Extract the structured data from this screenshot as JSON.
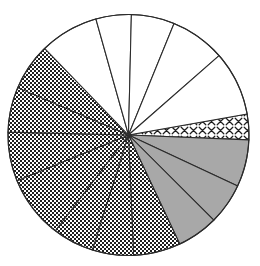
{
  "figure": {
    "title": "",
    "background_color": "#ffffff",
    "outline_color": "#2b2b2b"
  },
  "geometry": {
    "center_x": 128.5,
    "center_y": 135.0,
    "radius": 120.5,
    "stroke_width": 1.05
  },
  "fills": {
    "white": "#ffffff",
    "gray": "#a8a8a8",
    "dotted_bg": "#ffffff",
    "dotted_dot": "#1e1e1e",
    "xhatch_bg": "#ffffff",
    "xhatch_mark": "#1e1e1e",
    "edge": "#2b2b2b"
  },
  "chart_data": {
    "type": "pie",
    "title": "",
    "xlabel": "",
    "ylabel": "",
    "legend_position": "none",
    "grid": false,
    "total_slices": 16,
    "start_angle_deg": -10,
    "direction": "clockwise",
    "categories": [
      "Slice 1",
      "Slice 2",
      "Slice 3",
      "Slice 4",
      "Slice 5",
      "Slice 6",
      "Slice 7",
      "Slice 8",
      "Slice 9",
      "Slice 10",
      "Slice 11",
      "Slice 12",
      "Slice 13",
      "Slice 14",
      "Slice 15",
      "Slice 16"
    ],
    "values": [
      13,
      24,
      21,
      21,
      24,
      21,
      21,
      32,
      25,
      23,
      24,
      30,
      18,
      22,
      28,
      33
    ],
    "angles_deg": [
      13,
      24,
      21,
      21,
      24,
      21,
      21,
      32,
      25,
      23,
      24,
      30,
      18,
      22,
      28,
      33
    ],
    "patterns": [
      "xhatch",
      "gray",
      "gray",
      "gray",
      "dotted",
      "dotted",
      "dotted",
      "dotted",
      "dotted",
      "dotted",
      "dotted",
      "white",
      "white",
      "white",
      "white",
      "white"
    ],
    "pattern_groups": [
      {
        "name": "x-hatched",
        "slice_count": 1,
        "fill": "cross-hatch"
      },
      {
        "name": "solid-gray",
        "slice_count": 3,
        "fill": "#a8a8a8"
      },
      {
        "name": "dotted",
        "slice_count": 7,
        "fill": "dot-grid"
      },
      {
        "name": "white",
        "slice_count": 5,
        "fill": "#ffffff"
      }
    ]
  }
}
